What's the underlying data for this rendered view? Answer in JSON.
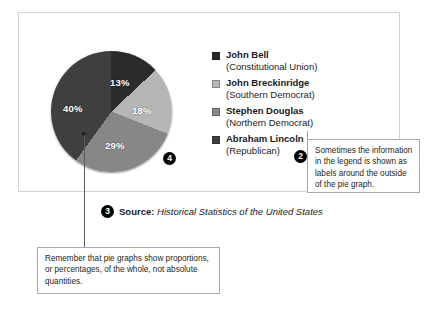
{
  "chart_data": {
    "type": "pie",
    "title": "",
    "categories": [
      "John Bell (Constitutional Union)",
      "John Breckinridge (Southern Democrat)",
      "Stephen Douglas (Northern Democrat)",
      "Abraham Lincoln (Republican)"
    ],
    "values": [
      13,
      18,
      29,
      40
    ],
    "value_labels": [
      "13%",
      "18%",
      "29%",
      "40%"
    ],
    "units": "percent",
    "slice_colors": [
      "#2b2b2b",
      "#b6b6b6",
      "#878787",
      "#3f3f3f"
    ],
    "start_angle_deg": 0,
    "direction": "clockwise",
    "legend_position": "right",
    "grid": false,
    "source": "Historical Statistics of the United States"
  },
  "figure": {
    "pie": {
      "slices": [
        {
          "label": "13%",
          "color": "#2b2b2b"
        },
        {
          "label": "18%",
          "color": "#b6b6b6"
        },
        {
          "label": "29%",
          "color": "#878787"
        },
        {
          "label": "40%",
          "color": "#3f3f3f"
        }
      ]
    },
    "legend": {
      "items": [
        {
          "swatch": "#2b2b2b",
          "name": "John Bell",
          "party": "(Constitutional Union)"
        },
        {
          "swatch": "#b6b6b6",
          "name": "John Breckinridge",
          "party": "(Southern Democrat)"
        },
        {
          "swatch": "#878787",
          "name": "Stephen Douglas",
          "party": "(Northern Democrat)"
        },
        {
          "swatch": "#3f3f3f",
          "name": "Abraham Lincoln",
          "party": "(Republican)"
        }
      ]
    },
    "source": {
      "label": "Source:",
      "title": "Historical Statistics of the United States"
    }
  },
  "markers": {
    "pie": "4",
    "legend": "2",
    "source": "3"
  },
  "callouts": {
    "legend_note": "Sometimes the information in the legend is shown as labels around the outside of the pie graph.",
    "proportions_note": "Remember that pie graphs show proportions, or percentages, of the whole, not absolute quantities."
  }
}
